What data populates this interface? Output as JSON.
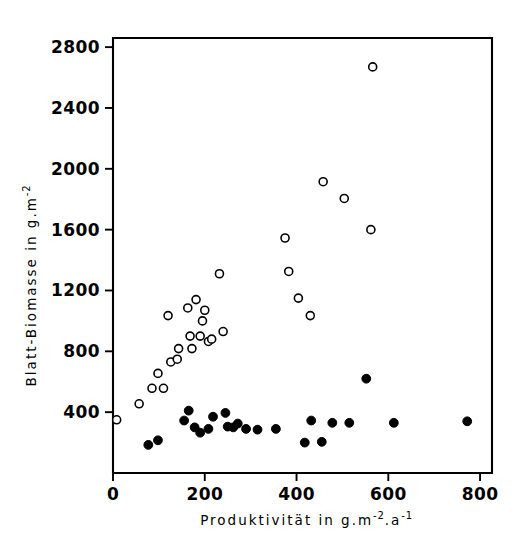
{
  "chart_data": {
    "type": "scatter",
    "title": "",
    "xlabel": "Produktivität in g.m-2.a-1",
    "ylabel": "Blatt-Biomasse in g.m-2",
    "xlabel_parts": {
      "base1": "Produktivität in g.m",
      "sup1": "-2",
      "base2": ".a",
      "sup2": "-1"
    },
    "ylabel_parts": {
      "base1": "Blatt-Biomasse in g.m",
      "sup1": "-2"
    },
    "xlim": [
      0,
      800
    ],
    "ylim": [
      0,
      2800
    ],
    "xticks": [
      0,
      200,
      400,
      600,
      800
    ],
    "xtick_labels": [
      "0",
      "200",
      "400",
      "600",
      "800"
    ],
    "yticks": [
      400,
      800,
      1200,
      1600,
      2000,
      2400,
      2800
    ],
    "ytick_labels": [
      "400",
      "800",
      "1200",
      "1600",
      "2000",
      "2400",
      "2800"
    ],
    "grid": false,
    "legend": "none",
    "frame": "box",
    "marker_colors": {
      "open": "#ffffff",
      "open_edge": "#000000",
      "filled": "#000000"
    },
    "series": [
      {
        "name": "open-circles",
        "marker": "open-circle",
        "points": [
          [
            8,
            350
          ],
          [
            57,
            455
          ],
          [
            85,
            557
          ],
          [
            98,
            655
          ],
          [
            110,
            557
          ],
          [
            120,
            1035
          ],
          [
            126,
            730
          ],
          [
            140,
            748
          ],
          [
            143,
            818
          ],
          [
            163,
            1085
          ],
          [
            168,
            900
          ],
          [
            172,
            818
          ],
          [
            181,
            1140
          ],
          [
            190,
            900
          ],
          [
            195,
            1000
          ],
          [
            200,
            1070
          ],
          [
            208,
            865
          ],
          [
            215,
            880
          ],
          [
            232,
            1310
          ],
          [
            240,
            930
          ],
          [
            375,
            1545
          ],
          [
            383,
            1325
          ],
          [
            404,
            1150
          ],
          [
            430,
            1035
          ],
          [
            458,
            1915
          ],
          [
            504,
            1805
          ],
          [
            562,
            1600
          ],
          [
            566,
            2670
          ]
        ]
      },
      {
        "name": "filled-circles",
        "marker": "filled-circle",
        "points": [
          [
            77,
            185
          ],
          [
            98,
            215
          ],
          [
            155,
            345
          ],
          [
            165,
            410
          ],
          [
            178,
            300
          ],
          [
            190,
            265
          ],
          [
            208,
            290
          ],
          [
            218,
            370
          ],
          [
            245,
            395
          ],
          [
            250,
            305
          ],
          [
            262,
            300
          ],
          [
            272,
            325
          ],
          [
            290,
            290
          ],
          [
            315,
            285
          ],
          [
            355,
            290
          ],
          [
            418,
            200
          ],
          [
            432,
            345
          ],
          [
            455,
            205
          ],
          [
            478,
            330
          ],
          [
            515,
            330
          ],
          [
            552,
            620
          ],
          [
            612,
            330
          ],
          [
            772,
            340
          ]
        ]
      }
    ]
  },
  "plot_geometry": {
    "left_px": 113,
    "right_px": 492,
    "top_px": 38,
    "bottom_px": 473,
    "x_min": 0,
    "x_max": 826,
    "y_min": 0,
    "y_max": 2860
  }
}
